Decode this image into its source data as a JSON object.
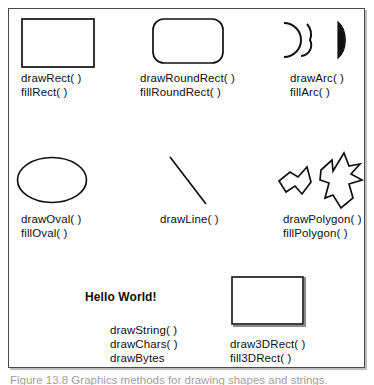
{
  "figure": {
    "background_color": "#ffffff",
    "stroke_color": "#111111",
    "frame_border_color": "#4a4a4a",
    "caption": "Figure 13.8  Graphics methods for drawing shapes and strings."
  },
  "cells": [
    {
      "id": "rect",
      "shape": "rectangle",
      "shape_name": "rectangle-shape",
      "labels": [
        "drawRect( )",
        "fillRect( )"
      ]
    },
    {
      "id": "round-rect",
      "shape": "rounded-rectangle",
      "shape_name": "rounded-rectangle-shape",
      "labels": [
        "drawRoundRect( )",
        "fillRoundRect( )"
      ]
    },
    {
      "id": "arc",
      "shape": "arcs",
      "shape_name": "arc-shape",
      "labels": [
        "drawArc( )",
        "fillArc( )"
      ]
    },
    {
      "id": "oval",
      "shape": "ellipse",
      "shape_name": "oval-shape",
      "labels": [
        "drawOval( )",
        "fillOval( )"
      ]
    },
    {
      "id": "line",
      "shape": "line",
      "shape_name": "line-shape",
      "labels": [
        "drawLine( )"
      ]
    },
    {
      "id": "polygon",
      "shape": "polygons",
      "shape_name": "polygon-shape",
      "labels": [
        "drawPolygon( )",
        "fillPolygon( )"
      ]
    },
    {
      "id": "string",
      "shape": "text-sample",
      "shape_name": "hello-world-text",
      "sample_text": "Hello World!",
      "labels": [
        "drawString( )",
        "drawChars( )",
        "drawBytes"
      ]
    },
    {
      "id": "rect-3d",
      "shape": "3d-rectangle",
      "shape_name": "three-d-rectangle-shape",
      "labels": [
        "draw3DRect( )",
        "fill3DRect( )"
      ]
    }
  ]
}
